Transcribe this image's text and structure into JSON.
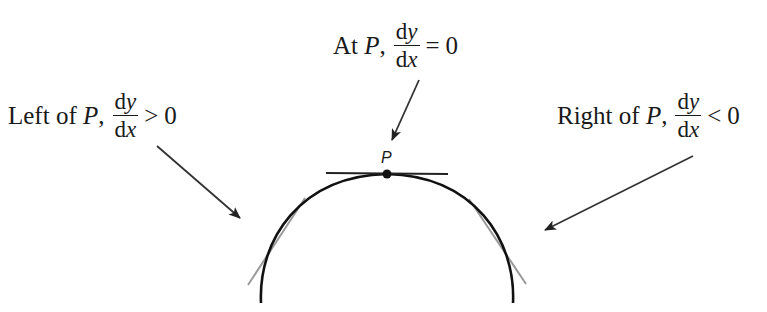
{
  "diagram": {
    "type": "curve-with-tangents",
    "point_label": "P",
    "colors": {
      "curve": "#111111",
      "tangent_at_p": "#222222",
      "side_tangents": "#9a9a9a",
      "arrows": "#333333",
      "text": "#1a1a1a"
    },
    "labels": {
      "top": {
        "prefix": "At ",
        "point": "P",
        "comma": ",",
        "numerator": "dy",
        "denominator": "dx",
        "relation": "=",
        "value": "0"
      },
      "left": {
        "prefix": "Left of ",
        "point": "P",
        "comma": ",",
        "numerator": "dy",
        "denominator": "dx",
        "relation": ">",
        "value": "0"
      },
      "right": {
        "prefix": "Right of ",
        "point": "P",
        "comma": ",",
        "numerator": "dy",
        "denominator": "dx",
        "relation": "<",
        "value": "0"
      }
    }
  }
}
